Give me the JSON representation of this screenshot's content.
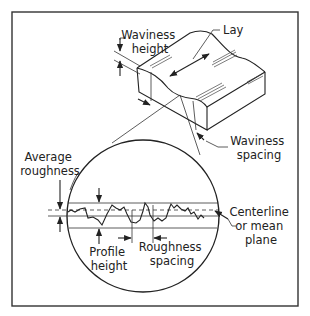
{
  "figure": {
    "colors": {
      "line": "#222222",
      "background": "#ffffff",
      "frame": "#333333"
    },
    "labels": {
      "waviness_height": [
        "Waviness",
        "height"
      ],
      "lay": "Lay",
      "waviness_spacing": [
        "Waviness",
        "spacing"
      ],
      "average_roughness": [
        "Average",
        "roughness"
      ],
      "centerline": [
        "Centerline",
        "or mean",
        "plane"
      ],
      "profile_height": [
        "Profile",
        "height"
      ],
      "roughness_spacing": [
        "Roughness",
        "spacing"
      ]
    },
    "parts": {
      "workpiece_block": "isometric block with wavy top surface",
      "magnifier_circle": "enlarged surface profile cross-section",
      "reference_lines": [
        "upper roughness bound",
        "centerline (dashed)",
        "average roughness bound",
        "lower profile bound"
      ]
    }
  }
}
